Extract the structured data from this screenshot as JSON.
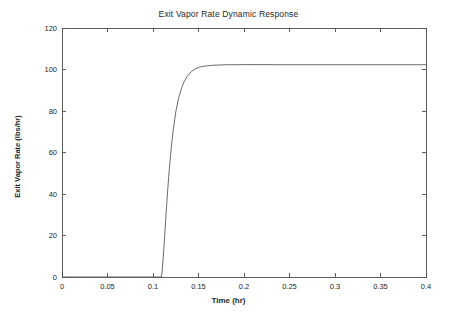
{
  "figure": {
    "background_color": "#ffffff",
    "line_color": "#555b63",
    "axis_color": "#4d4d4d"
  },
  "chart_data": {
    "type": "line",
    "title": "Exit Vapor Rate Dynamic Response",
    "xlabel": "Time (hr)",
    "ylabel": "Exit Vapor Rate (lbs/hr)",
    "xlim": [
      0,
      0.4
    ],
    "ylim": [
      0,
      120
    ],
    "grid": false,
    "legend": null,
    "xticks": [
      0,
      0.05,
      0.1,
      0.15,
      0.2,
      0.25,
      0.3,
      0.35,
      0.4
    ],
    "xticklabels": [
      "0",
      "0.05",
      "0.1",
      "0.15",
      "0.2",
      "0.25",
      "0.3",
      "0.35",
      "0.4"
    ],
    "yticks": [
      0,
      20,
      40,
      60,
      80,
      100,
      120
    ],
    "yticklabels": [
      "0",
      "20",
      "40",
      "60",
      "80",
      "100",
      "120"
    ],
    "series": [
      {
        "name": "Exit Vapor Rate",
        "x": [
          0,
          0.02,
          0.04,
          0.06,
          0.08,
          0.1,
          0.108,
          0.109,
          0.11,
          0.112,
          0.114,
          0.116,
          0.118,
          0.12,
          0.122,
          0.125,
          0.128,
          0.131,
          0.134,
          0.138,
          0.142,
          0.146,
          0.151,
          0.156,
          0.162,
          0.168,
          0.175,
          0.182,
          0.19,
          0.2,
          0.21,
          0.22,
          0.24,
          0.26,
          0.28,
          0.3,
          0.32,
          0.34,
          0.36,
          0.38,
          0.4
        ],
        "y": [
          0,
          0,
          0,
          0,
          0,
          0,
          0,
          0,
          2.5,
          14,
          28,
          41,
          52.5,
          62,
          70,
          79.5,
          86,
          90.5,
          94,
          97,
          99,
          100.2,
          101.1,
          101.6,
          101.9,
          102.1,
          102.2,
          102.3,
          102.3,
          102.35,
          102.35,
          102.35,
          102.3,
          102.3,
          102.3,
          102.3,
          102.3,
          102.3,
          102.3,
          102.3,
          102.3
        ]
      }
    ],
    "annotations": {
      "step_time_hr": 0.109,
      "steady_state_value": 102.3,
      "initial_value": 0
    }
  }
}
